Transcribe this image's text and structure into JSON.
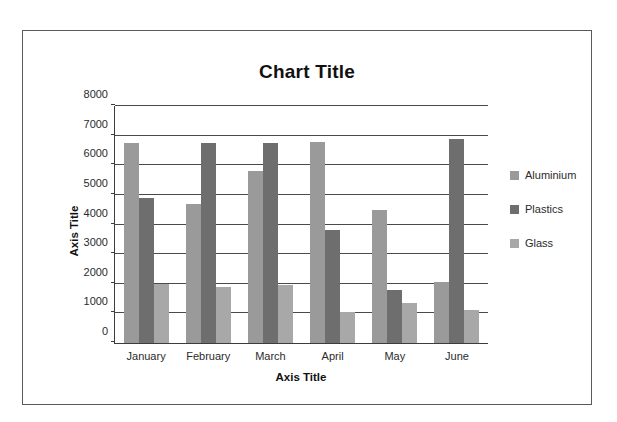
{
  "frame": {
    "border_color": "#5a5a5a"
  },
  "chart_data": {
    "type": "bar",
    "title": "Chart Title",
    "xlabel": "Axis Title",
    "ylabel": "Axis Title",
    "categories": [
      "January",
      "February",
      "March",
      "April",
      "May",
      "June"
    ],
    "series": [
      {
        "name": "Aluminium",
        "color": "#9a9a9a",
        "values": [
          6750,
          4700,
          5800,
          6800,
          4500,
          2050
        ]
      },
      {
        "name": "Plastics",
        "color": "#6e6e6e",
        "values": [
          4900,
          6750,
          6750,
          3800,
          1800,
          6900
        ]
      },
      {
        "name": "Glass",
        "color": "#a8a8a8",
        "values": [
          2000,
          1900,
          1950,
          1050,
          1350,
          1100
        ]
      }
    ],
    "ylim": [
      0,
      8000
    ],
    "ytick_values": [
      8000,
      7000,
      6000,
      5000,
      4000,
      3000,
      2000,
      1000,
      0
    ],
    "ytick_labels": [
      "8000",
      "7000",
      "6000",
      "5000",
      "4000",
      "3000",
      "2000",
      "1000",
      "0"
    ],
    "grid": true,
    "legend_position": "right"
  }
}
